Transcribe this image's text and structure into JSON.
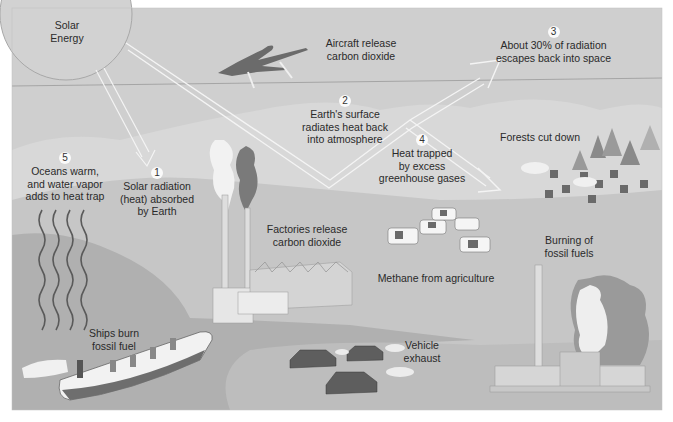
{
  "diagram": {
    "sun": {
      "label_lines": [
        "Solar",
        "Energy"
      ]
    },
    "steps": [
      {
        "number": "1",
        "lines": [
          "Solar radiation",
          "(heat) absorbed",
          "by Earth"
        ]
      },
      {
        "number": "2",
        "lines": [
          "Earth's surface",
          "radiates heat back",
          "into atmosphere"
        ]
      },
      {
        "number": "3",
        "lines": [
          "About 30% of radiation",
          "escapes back into space"
        ]
      },
      {
        "number": "4",
        "lines": [
          "Heat trapped",
          "by excess",
          "greenhouse gases"
        ]
      },
      {
        "number": "5",
        "lines": [
          "Oceans warm,",
          "and water vapor",
          "adds to heat trap"
        ]
      }
    ],
    "sources": {
      "aircraft": {
        "lines": [
          "Aircraft release",
          "carbon dioxide"
        ]
      },
      "factories": {
        "lines": [
          "Factories release",
          "carbon dioxide"
        ]
      },
      "methane": {
        "lines": [
          "Methane from agriculture"
        ]
      },
      "forests": {
        "lines": [
          "Forests cut down"
        ]
      },
      "burning": {
        "lines": [
          "Burning of",
          "fossil fuels"
        ]
      },
      "ships": {
        "lines": [
          "Ships burn",
          "fossil fuel"
        ]
      },
      "vehicles": {
        "lines": [
          "Vehicle",
          "exhaust"
        ]
      }
    },
    "colors": {
      "sky": "#cfcfcf",
      "horizon_line": "#9a9a9a",
      "hills": "#dcdcdc",
      "land": "#c4c4c4",
      "sea": "#a9a9a9",
      "arrow": "#f4f4f4",
      "text": "#2a2a2a"
    }
  }
}
